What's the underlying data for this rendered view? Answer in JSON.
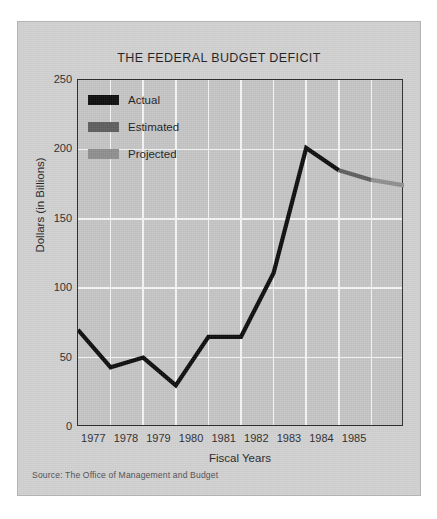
{
  "figure": {
    "title": "THE FEDERAL BUDGET DEFICIT",
    "source_note": "Source: The Office of Management and Budget",
    "card_color": "#cfcfcf",
    "plot_bg_color": "#c3c3c3",
    "grid_color": "#f4f4f4",
    "axis_color": "#2a2a2a"
  },
  "legend": {
    "position": "inside-top-left",
    "items": [
      {
        "label": "Actual",
        "color": "#0b0b0b",
        "swatch_name": "legend-swatch-actual"
      },
      {
        "label": "Estimated",
        "color": "#5c5c5c",
        "swatch_name": "legend-swatch-estimated"
      },
      {
        "label": "Projected",
        "color": "#8d8d8d",
        "swatch_name": "legend-swatch-projected"
      }
    ]
  },
  "chart_data": {
    "type": "line",
    "title": "THE FEDERAL BUDGET DEFICIT",
    "subtitle": "",
    "xlabel": "Fiscal Years",
    "ylabel": "Dollars (in Billions)",
    "x": [
      1976,
      1977,
      1978,
      1979,
      1980,
      1981,
      1982,
      1983,
      1984,
      1985,
      1986
    ],
    "xtick_labels": [
      "1977",
      "1978",
      "1979",
      "1980",
      "1981",
      "1982",
      "1983",
      "1984",
      "1985"
    ],
    "ytick_labels": [
      "0",
      "50",
      "100",
      "150",
      "200",
      "250"
    ],
    "ytick_values": [
      0,
      50,
      100,
      150,
      200,
      250
    ],
    "xlim": [
      1976,
      1986
    ],
    "ylim": [
      0,
      250
    ],
    "grid": true,
    "units": "billions of dollars",
    "series": [
      {
        "name": "Actual",
        "color": "#0b0b0b",
        "x": [
          1976,
          1977,
          1978,
          1979,
          1980,
          1981,
          1982,
          1983,
          1984
        ],
        "values": [
          70,
          43,
          50,
          30,
          65,
          65,
          111,
          201,
          185
        ]
      },
      {
        "name": "Estimated",
        "color": "#5c5c5c",
        "x": [
          1984,
          1985
        ],
        "values": [
          185,
          178
        ]
      },
      {
        "name": "Projected",
        "color": "#8d8d8d",
        "x": [
          1985,
          1986
        ],
        "values": [
          178,
          174
        ]
      }
    ],
    "annotations": [
      "Source: The Office of Management and Budget"
    ]
  }
}
